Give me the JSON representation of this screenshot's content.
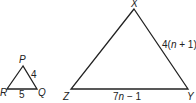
{
  "diagram": {
    "triangles": [
      {
        "name": "PQR",
        "vertices": {
          "P": {
            "label": "P"
          },
          "Q": {
            "label": "Q"
          },
          "R": {
            "label": "R"
          }
        },
        "sides": {
          "PQ": {
            "label": "4"
          },
          "RQ": {
            "label": "5"
          }
        }
      },
      {
        "name": "XYZ",
        "vertices": {
          "X": {
            "label": "X"
          },
          "Y": {
            "label": "Y"
          },
          "Z": {
            "label": "Z"
          }
        },
        "sides": {
          "XY": {
            "label_coef": "4(",
            "label_var": "n",
            "label_rest": " + 1)"
          },
          "ZY": {
            "label_coef": "7",
            "label_var": "n",
            "label_rest": " − 1"
          }
        }
      }
    ]
  }
}
